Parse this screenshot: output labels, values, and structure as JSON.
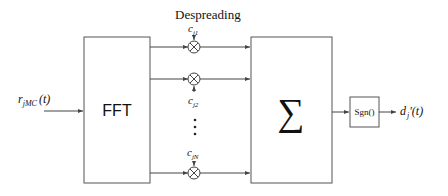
{
  "diagram": {
    "title": "Despreading",
    "input_signal": {
      "main": "r",
      "sub": "jMC",
      "arg": "(t)"
    },
    "fft_label": "FFT",
    "sum_label": "∑",
    "sgn_label": "Sgn()",
    "output_signal": {
      "main": "d",
      "sub": "j",
      "arg": "'(t)"
    },
    "codes": [
      {
        "main": "c",
        "sub": "j1"
      },
      {
        "main": "c",
        "sub": "j2"
      },
      {
        "main": "c",
        "sub": "jN"
      }
    ],
    "ellipsis": "⋮",
    "colors": {
      "line": "#444444",
      "text": "#111111",
      "background": "#ffffff"
    }
  }
}
